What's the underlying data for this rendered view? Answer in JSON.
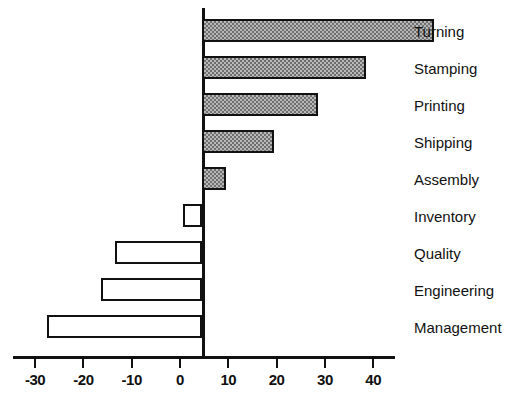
{
  "chart_data": {
    "type": "bar",
    "orientation": "horizontal",
    "title": "",
    "xlabel": "",
    "ylabel": "",
    "categories": [
      "Turning",
      "Stamping",
      "Printing",
      "Shipping",
      "Assembly",
      "Inventory",
      "Quality",
      "Engineering",
      "Management"
    ],
    "values": [
      48,
      34,
      24,
      15,
      5,
      -4,
      -18,
      -21,
      -32
    ],
    "series": [
      {
        "name": "Change",
        "values": [
          48,
          34,
          24,
          15,
          5,
          -4,
          -18,
          -21,
          -32
        ]
      }
    ],
    "xlim": [
      -36,
      50
    ],
    "xticks": [
      -30,
      -20,
      -10,
      0,
      10,
      20,
      30,
      40
    ],
    "xticklabels": [
      "-30",
      "-20",
      "-10",
      "0",
      "10",
      "20",
      "30",
      "40"
    ],
    "grid": false,
    "legend": false,
    "bar_styles": {
      "positive": "hatched-grey",
      "negative": "white-outline"
    },
    "colors": {
      "axis": "#111111",
      "positive_fill": "#b9b9b9",
      "positive_pattern": "#6e6e6e",
      "negative_fill": "#ffffff",
      "outline": "#111111",
      "text": "#111111",
      "background": "#ffffff"
    }
  },
  "axis": {
    "tick_labels": [
      "-30",
      "-20",
      "-10",
      "0",
      "10",
      "20",
      "30",
      "40"
    ]
  },
  "categories": {
    "items": [
      {
        "label": "Turning"
      },
      {
        "label": "Stamping"
      },
      {
        "label": "Printing"
      },
      {
        "label": "Shipping"
      },
      {
        "label": "Assembly"
      },
      {
        "label": "Inventory"
      },
      {
        "label": "Quality"
      },
      {
        "label": "Engineering"
      },
      {
        "label": "Management"
      }
    ]
  }
}
